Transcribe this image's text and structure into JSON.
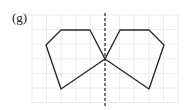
{
  "label": "(g)",
  "diagram": {
    "type": "line-of-symmetry",
    "grid": {
      "x0": 32,
      "y0": 15,
      "cols": 10,
      "rows": 6,
      "cell": 14.6,
      "color": "#ececec"
    },
    "axis": {
      "x": 105,
      "y1": 13,
      "y2": 107,
      "color": "#222222"
    },
    "left_shape": "61,30 90,30 105,59 61,89 46,45",
    "right_shape": "120,30 149,30 164,45 149,89 105,59",
    "stroke": "#2a2a2a"
  }
}
